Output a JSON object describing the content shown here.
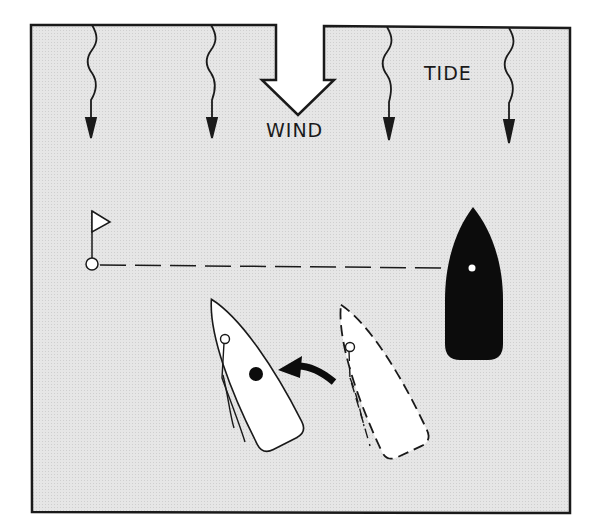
{
  "diagram": {
    "type": "sailing-maneuver",
    "labels": {
      "wind": "WIND",
      "tide": "TIDE"
    },
    "colors": {
      "water": "#e4e4e4",
      "outline": "#1a1a1a",
      "boat_fill": "#ffffff",
      "moored_boat": "#0c0c0c"
    },
    "elements": {
      "wind_arrow": "large hollow arrow pointing down",
      "tide_arrows": 4,
      "mark": "flag buoy",
      "moored_boat": "black boat",
      "boat_current": "solid outline boat",
      "boat_previous": "dashed outline boat",
      "turn_arrow": "curved black arrow"
    }
  }
}
